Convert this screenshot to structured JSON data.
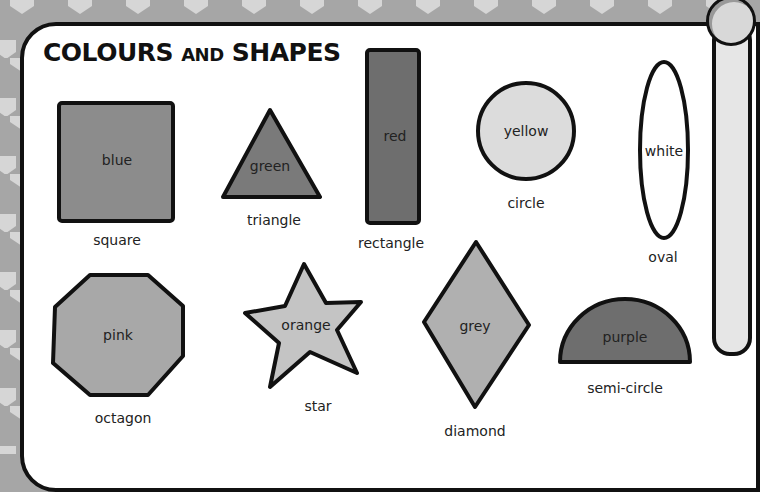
{
  "title": {
    "part1": "COLOURS",
    "part2": "AND",
    "part3": "SHAPES"
  },
  "colors": {
    "background": "#a6a6a6",
    "pattern": "#d6d6d6",
    "outline": "#111111"
  },
  "shapes": [
    {
      "shape": "square",
      "color": "blue",
      "fill": "#8c8c8c"
    },
    {
      "shape": "triangle",
      "color": "green",
      "fill": "#7a7a7a"
    },
    {
      "shape": "rectangle",
      "color": "red",
      "fill": "#6e6e6e"
    },
    {
      "shape": "circle",
      "color": "yellow",
      "fill": "#dcdcdc"
    },
    {
      "shape": "oval",
      "color": "white",
      "fill": "#ffffff"
    },
    {
      "shape": "octagon",
      "color": "pink",
      "fill": "#a8a8a8"
    },
    {
      "shape": "star",
      "color": "orange",
      "fill": "#c4c4c4"
    },
    {
      "shape": "diamond",
      "color": "grey",
      "fill": "#b0b0b0"
    },
    {
      "shape": "semi-circle",
      "color": "purple",
      "fill": "#6e6e6e"
    }
  ]
}
